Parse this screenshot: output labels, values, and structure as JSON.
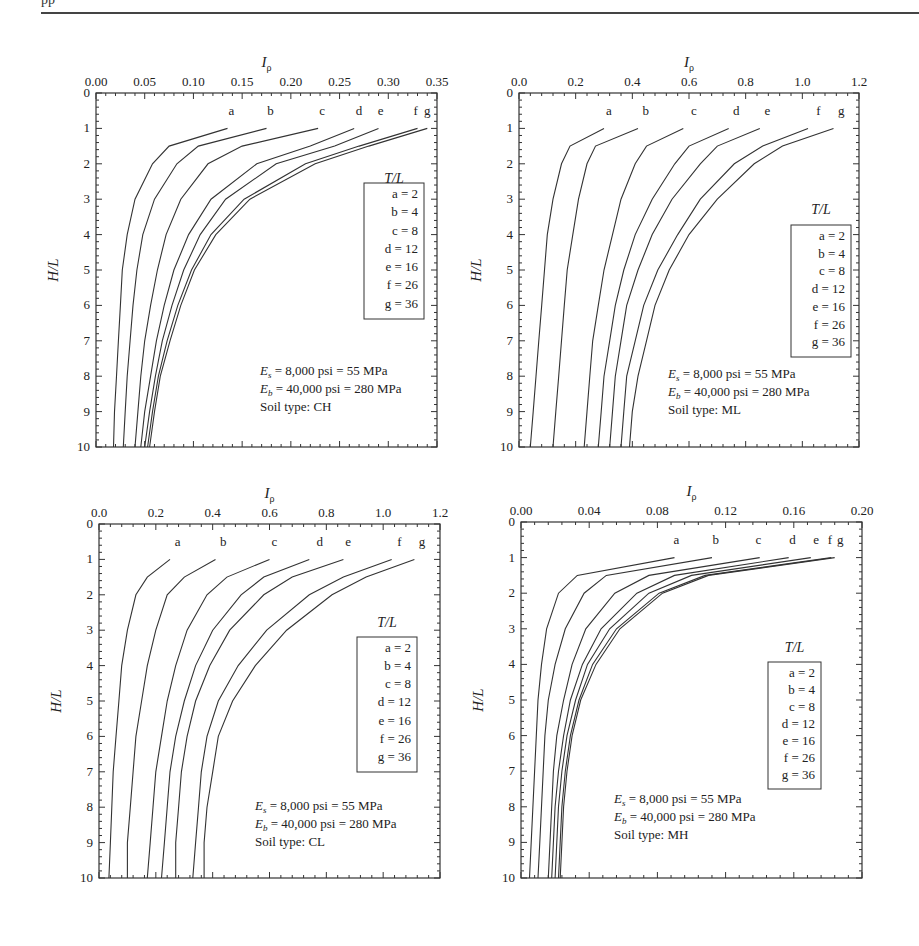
{
  "page": {
    "header_fragment": "pp"
  },
  "chart_data": [
    {
      "type": "line",
      "panel": "top-left",
      "title": "",
      "xlabel": "Iρ",
      "ylabel": "H/L",
      "xlim": [
        0,
        0.35
      ],
      "ylim": [
        0,
        10
      ],
      "x_axis_position": "top",
      "y_inverted": true,
      "xticks": [
        "0.00",
        "0.05",
        "0.10",
        "0.15",
        "0.20",
        "0.25",
        "0.30",
        "0.35"
      ],
      "yticks": [
        "0",
        "1",
        "2",
        "3",
        "4",
        "5",
        "6",
        "7",
        "8",
        "9",
        "10"
      ],
      "legend_title": "T/L",
      "legend": [
        "a = 2",
        "b = 4",
        "c = 8",
        "d = 12",
        "e = 16",
        "f = 26",
        "g = 36"
      ],
      "annotations": [
        "Es = 8,000 psi = 55 MPa",
        "Eb = 40,000 psi = 280 MPa",
        "Soil type: CH"
      ],
      "y": [
        1.0,
        1.5,
        2,
        3,
        4,
        5,
        6,
        7,
        8,
        9,
        10
      ],
      "series": [
        {
          "name": "a",
          "label_x": 0.137,
          "values": [
            0.135,
            0.075,
            0.058,
            0.04,
            0.032,
            0.027,
            0.025,
            0.023,
            0.021,
            0.019,
            0.018
          ]
        },
        {
          "name": "b",
          "label_x": 0.177,
          "values": [
            0.175,
            0.105,
            0.083,
            0.06,
            0.048,
            0.042,
            0.038,
            0.035,
            0.032,
            0.03,
            0.028
          ]
        },
        {
          "name": "c",
          "label_x": 0.23,
          "values": [
            0.228,
            0.15,
            0.115,
            0.087,
            0.072,
            0.063,
            0.056,
            0.05,
            0.046,
            0.043,
            0.04
          ]
        },
        {
          "name": "d",
          "label_x": 0.268,
          "values": [
            0.265,
            0.22,
            0.165,
            0.118,
            0.095,
            0.08,
            0.07,
            0.062,
            0.056,
            0.05,
            0.046
          ]
        },
        {
          "name": "e",
          "label_x": 0.29,
          "values": [
            0.29,
            0.245,
            0.185,
            0.133,
            0.107,
            0.09,
            0.078,
            0.068,
            0.061,
            0.055,
            0.05
          ]
        },
        {
          "name": "f",
          "label_x": 0.326,
          "values": [
            0.33,
            0.27,
            0.215,
            0.152,
            0.118,
            0.098,
            0.084,
            0.073,
            0.064,
            0.058,
            0.053
          ]
        },
        {
          "name": "g",
          "label_x": 0.338,
          "values": [
            0.34,
            0.28,
            0.225,
            0.158,
            0.123,
            0.101,
            0.087,
            0.076,
            0.066,
            0.06,
            0.055
          ]
        }
      ]
    },
    {
      "type": "line",
      "panel": "top-right",
      "title": "",
      "xlabel": "Iρ",
      "ylabel": "H/L",
      "xlim": [
        0,
        1.2
      ],
      "ylim": [
        0,
        10
      ],
      "x_axis_position": "top",
      "y_inverted": true,
      "xticks": [
        "0.0",
        "0.2",
        "0.4",
        "0.6",
        "0.8",
        "1.0",
        "1.2"
      ],
      "yticks": [
        "0",
        "1",
        "2",
        "3",
        "4",
        "5",
        "6",
        "7",
        "8",
        "9",
        "10"
      ],
      "legend_title": "T/L",
      "legend": [
        "a = 2",
        "b = 4",
        "c = 8",
        "d = 12",
        "e = 16",
        "f = 26",
        "g = 36"
      ],
      "annotations": [
        "Es = 8,000 psi = 55 MPa",
        "Eb = 40,000 psi = 280 MPa",
        "Soil type: ML"
      ],
      "y": [
        1.0,
        1.5,
        2,
        3,
        4,
        5,
        6,
        7,
        8,
        9,
        10
      ],
      "series": [
        {
          "name": "a",
          "label_x": 0.31,
          "values": [
            0.3,
            0.18,
            0.15,
            0.12,
            0.1,
            0.09,
            0.08,
            0.07,
            0.06,
            0.05,
            0.04
          ]
        },
        {
          "name": "b",
          "label_x": 0.44,
          "values": [
            0.42,
            0.27,
            0.24,
            0.21,
            0.19,
            0.17,
            0.16,
            0.15,
            0.14,
            0.13,
            0.12
          ]
        },
        {
          "name": "c",
          "label_x": 0.61,
          "values": [
            0.58,
            0.45,
            0.41,
            0.36,
            0.33,
            0.3,
            0.28,
            0.26,
            0.25,
            0.24,
            0.23
          ]
        },
        {
          "name": "d",
          "label_x": 0.76,
          "values": [
            0.74,
            0.6,
            0.55,
            0.47,
            0.41,
            0.37,
            0.34,
            0.32,
            0.3,
            0.29,
            0.28
          ]
        },
        {
          "name": "e",
          "label_x": 0.87,
          "values": [
            0.85,
            0.7,
            0.64,
            0.54,
            0.47,
            0.42,
            0.38,
            0.36,
            0.34,
            0.33,
            0.32
          ]
        },
        {
          "name": "f",
          "label_x": 1.05,
          "values": [
            1.02,
            0.86,
            0.76,
            0.64,
            0.56,
            0.49,
            0.44,
            0.41,
            0.38,
            0.37,
            0.36
          ]
        },
        {
          "name": "g",
          "label_x": 1.13,
          "values": [
            1.11,
            0.93,
            0.83,
            0.7,
            0.6,
            0.53,
            0.48,
            0.45,
            0.42,
            0.4,
            0.39
          ]
        }
      ]
    },
    {
      "type": "line",
      "panel": "bottom-left",
      "title": "",
      "xlabel": "Iρ",
      "ylabel": "H/L",
      "xlim": [
        0,
        1.2
      ],
      "ylim": [
        0,
        10
      ],
      "x_axis_position": "top",
      "y_inverted": true,
      "xticks": [
        "0.0",
        "0.2",
        "0.4",
        "0.6",
        "0.8",
        "1.0",
        "1.2"
      ],
      "yticks": [
        "0",
        "1",
        "2",
        "3",
        "4",
        "5",
        "6",
        "7",
        "8",
        "9",
        "10"
      ],
      "legend_title": "T/L",
      "legend": [
        "a = 2",
        "b = 4",
        "c = 8",
        "d = 12",
        "e = 16",
        "f = 26",
        "g = 36"
      ],
      "annotations": [
        "Es = 8,000 psi = 55 MPa",
        "Eb = 40,000 psi = 280 MPa",
        "Soil type: CL"
      ],
      "y": [
        1.0,
        1.5,
        2,
        3,
        4,
        5,
        6,
        7,
        8,
        9,
        10
      ],
      "series": [
        {
          "name": "a",
          "label_x": 0.27,
          "values": [
            0.25,
            0.17,
            0.13,
            0.1,
            0.08,
            0.07,
            0.06,
            0.05,
            0.045,
            0.04,
            0.035
          ]
        },
        {
          "name": "b",
          "label_x": 0.43,
          "values": [
            0.41,
            0.3,
            0.24,
            0.2,
            0.17,
            0.15,
            0.13,
            0.12,
            0.11,
            0.1,
            0.1
          ]
        },
        {
          "name": "c",
          "label_x": 0.61,
          "values": [
            0.6,
            0.45,
            0.38,
            0.31,
            0.27,
            0.24,
            0.22,
            0.2,
            0.19,
            0.18,
            0.17
          ]
        },
        {
          "name": "d",
          "label_x": 0.77,
          "values": [
            0.74,
            0.58,
            0.5,
            0.4,
            0.34,
            0.3,
            0.27,
            0.25,
            0.24,
            0.23,
            0.22
          ]
        },
        {
          "name": "e",
          "label_x": 0.87,
          "values": [
            0.86,
            0.68,
            0.58,
            0.46,
            0.39,
            0.34,
            0.31,
            0.29,
            0.28,
            0.27,
            0.27
          ]
        },
        {
          "name": "f",
          "label_x": 1.05,
          "values": [
            1.03,
            0.86,
            0.74,
            0.59,
            0.49,
            0.42,
            0.38,
            0.36,
            0.35,
            0.34,
            0.33
          ]
        },
        {
          "name": "g",
          "label_x": 1.13,
          "values": [
            1.11,
            0.94,
            0.82,
            0.66,
            0.55,
            0.47,
            0.42,
            0.4,
            0.38,
            0.37,
            0.37
          ]
        }
      ]
    },
    {
      "type": "line",
      "panel": "bottom-right",
      "title": "",
      "xlabel": "Iρ",
      "ylabel": "H/L",
      "xlim": [
        0,
        0.2
      ],
      "ylim": [
        0,
        10
      ],
      "x_axis_position": "top",
      "y_inverted": true,
      "xticks": [
        "0.00",
        "0.04",
        "0.08",
        "0.12",
        "0.16",
        "0.20"
      ],
      "yticks": [
        "0",
        "1",
        "2",
        "3",
        "4",
        "5",
        "6",
        "7",
        "8",
        "9",
        "10"
      ],
      "legend_title": "T/L",
      "legend": [
        "a = 2",
        "b = 4",
        "c = 8",
        "d = 12",
        "e = 16",
        "f = 26",
        "g = 36"
      ],
      "annotations": [
        "Es = 8,000 psi = 55 MPa",
        "Eb = 40,000 psi = 280 MPa",
        "Soil type: MH"
      ],
      "y": [
        1.0,
        1.5,
        2,
        3,
        4,
        5,
        6,
        7,
        8,
        9,
        10
      ],
      "series": [
        {
          "name": "a",
          "label_x": 0.09,
          "values": [
            0.09,
            0.033,
            0.022,
            0.015,
            0.012,
            0.01,
            0.009,
            0.008,
            0.007,
            0.006,
            0.005
          ]
        },
        {
          "name": "b",
          "label_x": 0.113,
          "values": [
            0.112,
            0.05,
            0.037,
            0.026,
            0.02,
            0.016,
            0.014,
            0.013,
            0.012,
            0.011,
            0.01
          ]
        },
        {
          "name": "c",
          "label_x": 0.138,
          "values": [
            0.14,
            0.075,
            0.055,
            0.038,
            0.03,
            0.025,
            0.021,
            0.019,
            0.018,
            0.017,
            0.016
          ]
        },
        {
          "name": "d",
          "label_x": 0.158,
          "values": [
            0.157,
            0.09,
            0.068,
            0.047,
            0.036,
            0.029,
            0.025,
            0.022,
            0.02,
            0.019,
            0.018
          ]
        },
        {
          "name": "e",
          "label_x": 0.172,
          "values": [
            0.17,
            0.1,
            0.075,
            0.052,
            0.039,
            0.032,
            0.027,
            0.024,
            0.022,
            0.021,
            0.02
          ]
        },
        {
          "name": "f",
          "label_x": 0.18,
          "values": [
            0.182,
            0.108,
            0.081,
            0.056,
            0.042,
            0.034,
            0.029,
            0.026,
            0.024,
            0.023,
            0.022
          ]
        },
        {
          "name": "g",
          "label_x": 0.186,
          "values": [
            0.184,
            0.11,
            0.083,
            0.058,
            0.044,
            0.035,
            0.03,
            0.027,
            0.025,
            0.024,
            0.023
          ]
        }
      ]
    }
  ],
  "layout": {
    "panels": [
      {
        "x0": 96,
        "y0": 93,
        "x1": 437,
        "y1": 447,
        "legend": {
          "x": 364,
          "y": 183,
          "w": 60,
          "h": 136
        },
        "title_y": 183,
        "ann": {
          "x": 260,
          "y": 375
        }
      },
      {
        "x0": 519,
        "y0": 93,
        "x1": 859,
        "y1": 447,
        "legend": {
          "x": 791,
          "y": 225,
          "w": 60,
          "h": 132
        },
        "title_y": 214,
        "ann": {
          "x": 668,
          "y": 378
        }
      },
      {
        "x0": 99,
        "y0": 524,
        "x1": 440,
        "y1": 878,
        "legend": {
          "x": 357,
          "y": 637,
          "w": 60,
          "h": 135
        },
        "title_y": 627,
        "ann": {
          "x": 255,
          "y": 810
        }
      },
      {
        "x0": 521,
        "y0": 522,
        "x1": 862,
        "y1": 878,
        "legend": {
          "x": 768,
          "y": 662,
          "w": 53,
          "h": 127
        },
        "title_y": 652,
        "ann": {
          "x": 614,
          "y": 803
        }
      }
    ]
  }
}
